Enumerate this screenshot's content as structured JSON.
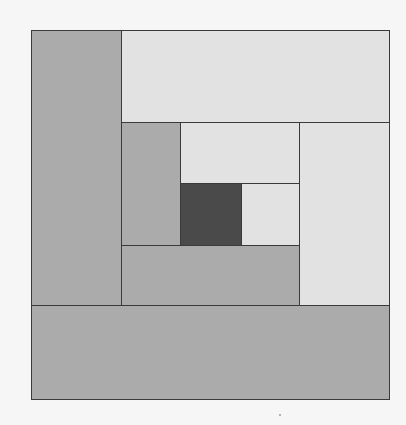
{
  "diagram": {
    "type": "log-cabin-quilt-block",
    "colors": {
      "background": "#f6f6f6",
      "medium_gray": "#ababab",
      "light_gray": "#e2e2e2",
      "dark_center": "#4a4a4a",
      "outline": "#3a3a3a"
    },
    "blocks": [
      {
        "name": "left-strip",
        "x": 31,
        "y": 30,
        "w": 90,
        "h": 275,
        "color": "#ababab"
      },
      {
        "name": "top-strip",
        "x": 121,
        "y": 30,
        "w": 268,
        "h": 92,
        "color": "#e2e2e2"
      },
      {
        "name": "right-strip",
        "x": 299,
        "y": 122,
        "w": 90,
        "h": 183,
        "color": "#e2e2e2"
      },
      {
        "name": "bottom-strip",
        "x": 31,
        "y": 305,
        "w": 358,
        "h": 94,
        "color": "#ababab"
      },
      {
        "name": "inner-left-strip",
        "x": 121,
        "y": 122,
        "w": 59,
        "h": 123,
        "color": "#ababab"
      },
      {
        "name": "inner-top-strip",
        "x": 180,
        "y": 122,
        "w": 119,
        "h": 61,
        "color": "#e2e2e2"
      },
      {
        "name": "inner-bottom-strip",
        "x": 121,
        "y": 245,
        "w": 178,
        "h": 60,
        "color": "#ababab"
      },
      {
        "name": "inner-right-strip",
        "x": 241,
        "y": 183,
        "w": 58,
        "h": 62,
        "color": "#e2e2e2"
      },
      {
        "name": "center-square",
        "x": 180,
        "y": 183,
        "w": 61,
        "h": 62,
        "color": "#4a4a4a"
      }
    ]
  }
}
